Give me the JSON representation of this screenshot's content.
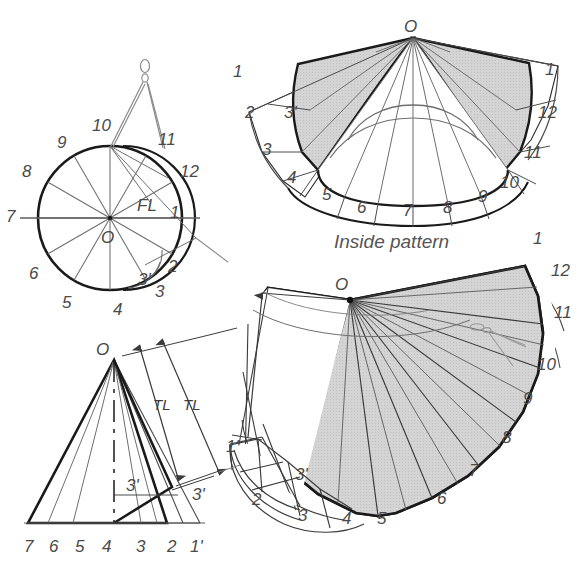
{
  "figure": {
    "background_color": "#ffffff",
    "ink_color": "#1a1a1a",
    "light_ink_color": "#7a7a7a",
    "fill_gray": "#d2d2d2",
    "label_color": "#4a4a4a"
  },
  "captions": {
    "inside_pattern": "Inside pattern"
  },
  "plan_view": {
    "name": "plan-circle-view",
    "center_label": "O",
    "true_length_label": "FL",
    "labels": [
      "1",
      "2",
      "3",
      "3'",
      "4",
      "5",
      "6",
      "7",
      "8",
      "9",
      "10",
      "11",
      "12"
    ],
    "tool_icon": "divider-compass-icon"
  },
  "inside_pattern_view": {
    "name": "inside-pattern-view",
    "apex_label": "O",
    "left_labels": [
      "1",
      "2",
      "3'",
      "3",
      "4"
    ],
    "bottom_labels": [
      "5",
      "6",
      "7",
      "8",
      "9"
    ],
    "right_labels": [
      "10",
      "11",
      "12",
      "1"
    ]
  },
  "elevation_view": {
    "name": "cone-elevation-view",
    "apex_label": "O",
    "dimension_labels": [
      "TL",
      "TL"
    ],
    "element_labels": [
      "3'",
      "3'"
    ],
    "base_labels": [
      "7",
      "6",
      "5",
      "4",
      "3",
      "2",
      "1'"
    ]
  },
  "outside_pattern_view": {
    "name": "outside-pattern-view",
    "apex_label": "O",
    "dimension_label": "TL",
    "labels": [
      "1'",
      "2",
      "3",
      "3'",
      "4",
      "5",
      "6",
      "7",
      "8",
      "9",
      "10",
      "11",
      "12",
      "1"
    ],
    "tool_icon": "divider-compass-icon"
  }
}
